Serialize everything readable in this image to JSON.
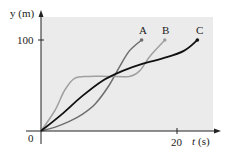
{
  "chart_data": {
    "type": "line",
    "title": "",
    "xlabel": "t (s)",
    "ylabel": "y (m)",
    "x_ticks": [
      {
        "value": 0,
        "label": "0"
      },
      {
        "value": 20,
        "label": "20"
      }
    ],
    "y_ticks": [
      {
        "value": 100,
        "label": "100"
      }
    ],
    "xlim": [
      0,
      25
    ],
    "ylim": [
      0,
      125
    ],
    "grid": false,
    "legend": "curve-end labels",
    "background_shading": "#ebebeb",
    "series": [
      {
        "name": "A",
        "color": "#6e6e6e",
        "points": [
          [
            0,
            0
          ],
          [
            2,
            4
          ],
          [
            4,
            10
          ],
          [
            6,
            18
          ],
          [
            8,
            30
          ],
          [
            10,
            50
          ],
          [
            11.5,
            70
          ],
          [
            13,
            88
          ],
          [
            14.8,
            100
          ]
        ]
      },
      {
        "name": "B",
        "color": "#a0a0a0",
        "points": [
          [
            0,
            0
          ],
          [
            2,
            22
          ],
          [
            3.5,
            45
          ],
          [
            5,
            58
          ],
          [
            7,
            60
          ],
          [
            10,
            60
          ],
          [
            13,
            60
          ],
          [
            14.5,
            66
          ],
          [
            16,
            82
          ],
          [
            18.2,
            100
          ]
        ]
      },
      {
        "name": "C",
        "color": "#111111",
        "points": [
          [
            0,
            0
          ],
          [
            3,
            18
          ],
          [
            6,
            38
          ],
          [
            9,
            55
          ],
          [
            12,
            66
          ],
          [
            15,
            74
          ],
          [
            18,
            80
          ],
          [
            21,
            88
          ],
          [
            23,
            100
          ]
        ]
      }
    ]
  },
  "axes": {
    "xlabel_italic": "t",
    "xlabel_unit": "(s)",
    "ylabel": "y (m)",
    "origin_label": "0",
    "x_tick_label": "20",
    "y_tick_label": "100"
  },
  "labels": {
    "A": "A",
    "B": "B",
    "C": "C"
  }
}
